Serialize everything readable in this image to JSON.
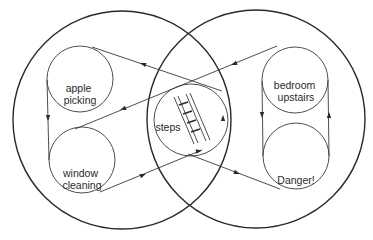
{
  "diagram": {
    "type": "nested-cycle venn diagram",
    "outer_sets": [
      {
        "id": "left-set",
        "label": ""
      },
      {
        "id": "right-set",
        "label": ""
      }
    ],
    "nodes": {
      "apple_picking": {
        "line1": "apple",
        "line2": "picking"
      },
      "window_cleaning": {
        "line1": "window",
        "line2": "cleaning"
      },
      "steps": {
        "label": "steps"
      },
      "bedroom_upstairs": {
        "line1": "bedroom",
        "line2": "upstairs"
      },
      "danger": {
        "label": "Danger!"
      }
    },
    "edges": [
      {
        "from": "steps",
        "to": "apple picking",
        "via": "line"
      },
      {
        "from": "apple picking",
        "to": "window cleaning",
        "via": "left side"
      },
      {
        "from": "window cleaning",
        "to": "steps",
        "via": "line"
      },
      {
        "from": "bedroom upstairs",
        "to": "window cleaning",
        "via": "line through steps"
      },
      {
        "from": "steps",
        "to": "Danger!",
        "via": "line"
      },
      {
        "from": "bedroom upstairs",
        "to": "Danger!",
        "via": "left side"
      },
      {
        "from": "Danger!",
        "to": "bedroom upstairs",
        "via": "right side"
      }
    ],
    "icons": {
      "steps_icon": "ladder-icon"
    },
    "colors": {
      "stroke": "#2a2a2a",
      "background": "#ffffff"
    }
  }
}
